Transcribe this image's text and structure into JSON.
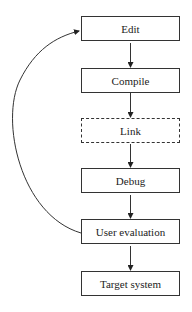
{
  "diagram": {
    "nodes": [
      {
        "id": "edit",
        "label": "Edit",
        "style": "solid"
      },
      {
        "id": "compile",
        "label": "Compile",
        "style": "solid"
      },
      {
        "id": "link",
        "label": "Link",
        "style": "dashed"
      },
      {
        "id": "debug",
        "label": "Debug",
        "style": "solid"
      },
      {
        "id": "user-evaluation",
        "label": "User evaluation",
        "style": "solid"
      },
      {
        "id": "target-system",
        "label": "Target system",
        "style": "solid"
      }
    ],
    "edges": [
      {
        "from": "edit",
        "to": "compile"
      },
      {
        "from": "compile",
        "to": "link"
      },
      {
        "from": "link",
        "to": "debug"
      },
      {
        "from": "debug",
        "to": "user-evaluation"
      },
      {
        "from": "user-evaluation",
        "to": "target-system"
      },
      {
        "from": "user-evaluation",
        "to": "edit",
        "type": "curved-feedback"
      }
    ]
  }
}
